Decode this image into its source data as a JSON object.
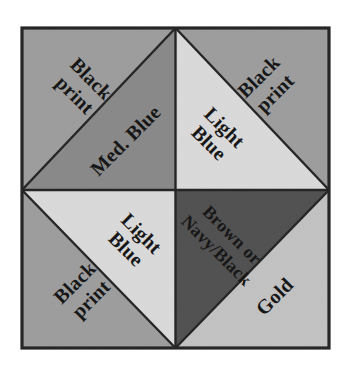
{
  "figure": {
    "frame_color": "#262626",
    "background_color": "#ffffff",
    "center_point": "center of block"
  },
  "palette": {
    "black_print": "#a0a0a0",
    "med_blue": "#8a8a8a",
    "light_blue": "#e3e3e3",
    "brown_navy_black": "#4c4c4c",
    "gold": "#c9c9c9",
    "line_color": "#262626",
    "text_color": "#171717"
  },
  "quadrants": [
    {
      "name": "top-left",
      "outer": {
        "label": "Black print",
        "lines": [
          "Black",
          "print"
        ],
        "color": "#a0a0a0"
      },
      "inner": {
        "label": "Med. Blue",
        "lines": [
          "Med. Blue"
        ],
        "color": "#8a8a8a"
      }
    },
    {
      "name": "top-right",
      "outer": {
        "label": "Black print",
        "lines": [
          "Black",
          "print"
        ],
        "color": "#a0a0a0"
      },
      "inner": {
        "label": "Light Blue",
        "lines": [
          "Light",
          "Blue"
        ],
        "color": "#e3e3e3"
      }
    },
    {
      "name": "bottom-left",
      "outer": {
        "label": "Black print",
        "lines": [
          "Black",
          "print"
        ],
        "color": "#a0a0a0"
      },
      "inner": {
        "label": "Light Blue",
        "lines": [
          "Light",
          "Blue"
        ],
        "color": "#e3e3e3"
      }
    },
    {
      "name": "bottom-right",
      "outer": {
        "label": "Gold",
        "lines": [
          "Gold"
        ],
        "color": "#c9c9c9"
      },
      "inner": {
        "label": "Brown or Navy/Black",
        "lines": [
          "Brown or",
          "Navy/Black"
        ],
        "color": "#4c4c4c"
      }
    }
  ],
  "labels": {
    "tl_outer_line1": "Black",
    "tl_outer_line2": "print",
    "tl_inner_line1": "Med. Blue",
    "tr_outer_line1": "Black",
    "tr_outer_line2": "print",
    "tr_inner_line1": "Light",
    "tr_inner_line2": "Blue",
    "bl_outer_line1": "Black",
    "bl_outer_line2": "print",
    "bl_inner_line1": "Light",
    "bl_inner_line2": "Blue",
    "br_inner_line1": "Brown or",
    "br_inner_line2": "Navy/Black",
    "br_outer_line1": "Gold"
  }
}
